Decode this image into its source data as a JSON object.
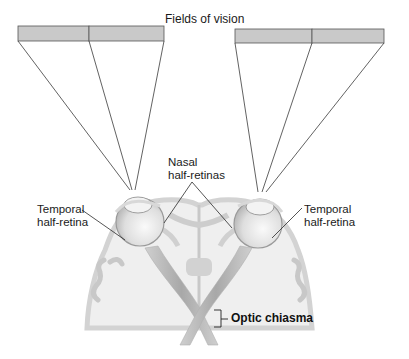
{
  "title": "Fields of vision",
  "labels": {
    "nasal": {
      "line1": "Nasal",
      "line2": "half-retinas"
    },
    "temporal_left": {
      "line1": "Temporal",
      "line2": "half-retina"
    },
    "temporal_right": {
      "line1": "Temporal",
      "line2": "half-retina"
    },
    "optic_chiasma": "Optic chiasma"
  },
  "fields": {
    "left": {
      "x": 18,
      "y": 26,
      "width": 146,
      "height": 15,
      "divider_x": 89
    },
    "right": {
      "x": 235,
      "y": 29,
      "width": 149,
      "height": 14,
      "divider_x": 312
    }
  },
  "colors": {
    "field_fill": "#c8c8c8",
    "field_stroke": "#555555",
    "line": "#3a3a3a",
    "brain_fill": "#efefef",
    "brain_stroke": "#cfcfcf",
    "nerve_fill": "#bdbdbd",
    "eye_fill": "#e4e4e4"
  }
}
